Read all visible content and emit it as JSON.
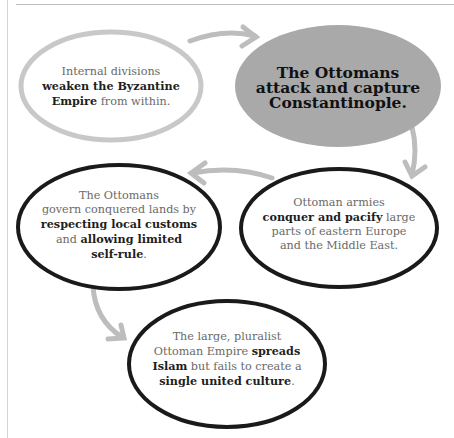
{
  "diagram": {
    "nodes": [
      {
        "id": "byzantine-divisions",
        "style": "light-outline",
        "segments": [
          {
            "text": "Internal divisions",
            "bold": false
          },
          {
            "text": "weaken the Byzantine Empire",
            "bold": true
          },
          {
            "text": "from within.",
            "bold": false
          }
        ],
        "lines": [
          "Internal divisions",
          "weaken the Byzantine",
          "Empire from within."
        ]
      },
      {
        "id": "capture-constantinople",
        "style": "filled",
        "lines": [
          "The Ottomans",
          "attack and capture",
          "Constantinople."
        ]
      },
      {
        "id": "conquer-pacify",
        "style": "dark-outline",
        "lines": [
          "Ottoman armies",
          "conquer and pacify large",
          "parts of eastern Europe",
          "and the Middle East."
        ]
      },
      {
        "id": "govern-lands",
        "style": "dark-outline",
        "lines": [
          "The Ottomans",
          "govern conquered lands by",
          "respecting local customs",
          "and allowing limited",
          "self-rule."
        ]
      },
      {
        "id": "spreads-islam",
        "style": "dark-outline",
        "lines": [
          "The large, pluralist",
          "Ottoman Empire spreads",
          "Islam but fails to create a",
          "single united culture."
        ]
      }
    ],
    "text": {
      "n1_l1": "Internal divisions",
      "n1_l2b": "weaken the Byzantine",
      "n1_l3b": "Empire",
      "n1_l3": " from within.",
      "n2_l1": "The Ottomans",
      "n2_l2": "attack and capture",
      "n2_l3": "Constantinople.",
      "n3_l1": "Ottoman armies",
      "n3_l2b": "conquer and pacify",
      "n3_l2": " large",
      "n3_l3": "parts of eastern Europe",
      "n3_l4": "and the Middle East.",
      "n4_l1": "The Ottomans",
      "n4_l2": "govern conquered lands by",
      "n4_l3b": "respecting local customs",
      "n4_l4a": "and ",
      "n4_l4b": "allowing limited",
      "n4_l5b": "self-rule",
      "n4_l5": ".",
      "n5_l1": "The large, pluralist",
      "n5_l2": "Ottoman Empire ",
      "n5_l2b": "spreads",
      "n5_l3b": "Islam",
      "n5_l3": " but fails to create a",
      "n5_l4b": "single united culture",
      "n5_l4": "."
    },
    "edges": [
      {
        "from": "byzantine-divisions",
        "to": "capture-constantinople"
      },
      {
        "from": "capture-constantinople",
        "to": "conquer-pacify"
      },
      {
        "from": "conquer-pacify",
        "to": "govern-lands"
      },
      {
        "from": "govern-lands",
        "to": "spreads-islam"
      }
    ],
    "colors": {
      "arrow": "#bdbdbd",
      "light_outline": "#c8c8c8",
      "dark_outline": "#1a1a1a",
      "filled": "#a9a9a9"
    }
  }
}
